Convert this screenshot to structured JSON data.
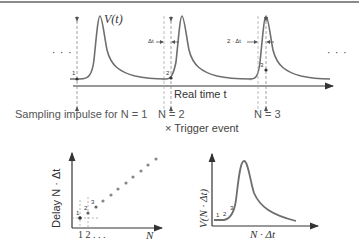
{
  "top_panel": {
    "signal_label": "V(t)",
    "ellipsis_left": "· · ·",
    "ellipsis_right": "· · ·",
    "axis_label": "Real time t",
    "delta_label_1": "Δt",
    "delta_label_2": "2 · Δt",
    "sample_points": [
      "1",
      "2",
      "3"
    ],
    "sampling_labels": [
      "Sampling impulse for N = 1",
      "N = 2",
      "N = 3"
    ],
    "legend": "× Trigger event"
  },
  "bottom_left_panel": {
    "ylabel": "Delay  N · Δt",
    "xlabel": "N",
    "xticks": "1 2 . . .",
    "point_labels": [
      "1",
      "2",
      "3"
    ]
  },
  "bottom_right_panel": {
    "ylabel": "V(N · Δt)",
    "xlabel": "N · Δt",
    "point_labels": [
      "1",
      "2",
      "3"
    ]
  },
  "colors": {
    "curve": "#6e6e6e",
    "axis": "#333333",
    "dashed": "#888888",
    "marker": "#555555"
  }
}
